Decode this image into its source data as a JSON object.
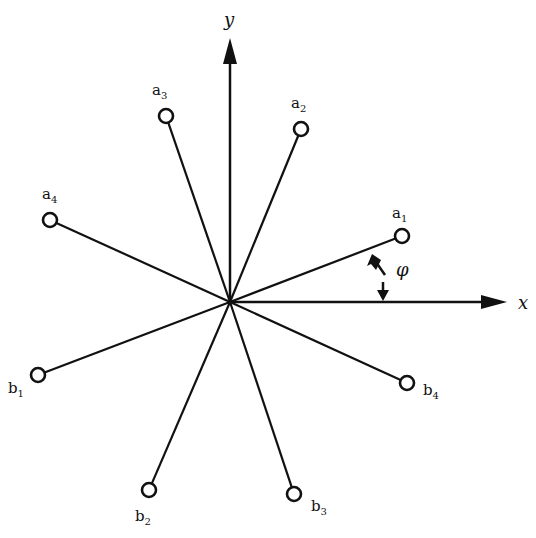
{
  "diagram": {
    "center": [
      230,
      302
    ],
    "axes": {
      "x_label": "x",
      "y_label": "y"
    },
    "angle_label": "φ",
    "nodes": [
      {
        "id": "a1",
        "base": "a",
        "sub": "1",
        "x": 402,
        "y": 236,
        "lx": 392,
        "ly": 218
      },
      {
        "id": "a2",
        "base": "a",
        "sub": "2",
        "x": 301,
        "y": 129,
        "lx": 291,
        "ly": 108
      },
      {
        "id": "a3",
        "base": "a",
        "sub": "3",
        "x": 166,
        "y": 116,
        "lx": 152,
        "ly": 95
      },
      {
        "id": "a4",
        "base": "a",
        "sub": "4",
        "x": 50,
        "y": 220,
        "lx": 42,
        "ly": 199
      },
      {
        "id": "b1",
        "base": "b",
        "sub": "1",
        "x": 38,
        "y": 375,
        "lx": 8,
        "ly": 393
      },
      {
        "id": "b2",
        "base": "b",
        "sub": "2",
        "x": 149,
        "y": 490,
        "lx": 135,
        "ly": 521
      },
      {
        "id": "b3",
        "base": "b",
        "sub": "3",
        "x": 294,
        "y": 494,
        "lx": 311,
        "ly": 511
      },
      {
        "id": "b4",
        "base": "b",
        "sub": "4",
        "x": 407,
        "y": 383,
        "lx": 423,
        "ly": 395
      }
    ]
  }
}
